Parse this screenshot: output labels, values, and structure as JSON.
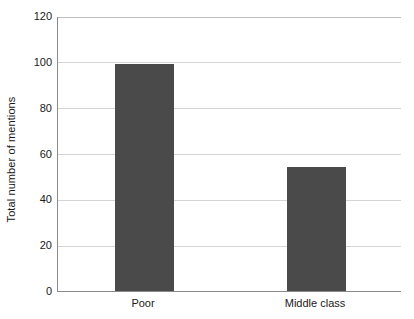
{
  "chart_data": {
    "type": "bar",
    "title": "",
    "subtitle": "",
    "xlabel": "",
    "ylabel": "Total number of mentions",
    "categories": [
      "Poor",
      "Middle class"
    ],
    "values": [
      99,
      54
    ],
    "series": [
      {
        "name": "Total number of mentions",
        "values": [
          99,
          54
        ]
      }
    ],
    "ylim": [
      0,
      120
    ],
    "yticks": [
      0,
      20,
      40,
      60,
      80,
      100,
      120
    ],
    "ytick_labels": [
      "0",
      "20",
      "40",
      "60",
      "80",
      "100",
      "120"
    ],
    "grid": true,
    "grid_axis": "y",
    "legend": false,
    "legend_position": "none",
    "bar_color": "#4a4a4a",
    "grid_color": "#d4d4d4",
    "axis_color": "#8a8a8a",
    "background_color": "#ffffff",
    "annotations": []
  }
}
